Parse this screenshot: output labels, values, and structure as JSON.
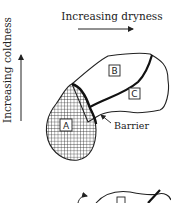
{
  "diagram": {
    "x_axis_label": "Increasing dryness",
    "y_axis_label": "Increasing coldness",
    "regions": [
      {
        "id": "A",
        "label": "A",
        "fill": "hatched grid"
      },
      {
        "id": "B",
        "label": "B"
      },
      {
        "id": "C",
        "label": "C"
      }
    ],
    "annotation": "Barrier",
    "colors": {
      "ink": "#222222",
      "background": "#ffffff"
    }
  }
}
